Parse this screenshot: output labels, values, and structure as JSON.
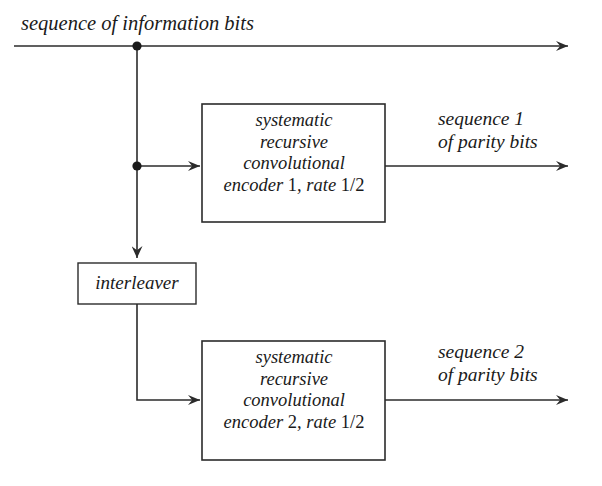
{
  "diagram": {
    "title_label": "sequence of information bits",
    "interleaver_label": "interleaver",
    "encoder1": {
      "line1": "systematic",
      "line2": "recursive",
      "line3": "convolutional",
      "line4_prefix": "encoder",
      "line4_index": "1",
      "line4_suffix": ", rate",
      "line4_rate": "1/2"
    },
    "encoder2": {
      "line1": "systematic",
      "line2": "recursive",
      "line3": "convolutional",
      "line4_prefix": "encoder",
      "line4_index": "2",
      "line4_suffix": ", rate",
      "line4_rate": "1/2"
    },
    "output1": {
      "line1": "sequence 1",
      "line2": "of parity bits"
    },
    "output2": {
      "line1": "sequence 2",
      "line2": "of parity bits"
    },
    "colors": {
      "background": "#ffffff",
      "stroke": "#2b2b2b",
      "text": "#1a1a1a"
    }
  }
}
